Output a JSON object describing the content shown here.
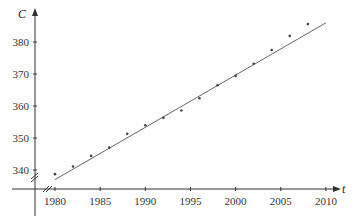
{
  "chart_data": {
    "type": "scatter",
    "title": "",
    "xlabel": "t",
    "ylabel": "C",
    "x_ticks": [
      1980,
      1985,
      1990,
      1995,
      2000,
      2005,
      2010
    ],
    "y_ticks": [
      340,
      350,
      360,
      370,
      380
    ],
    "xlim": [
      1977,
      2012
    ],
    "ylim": [
      334,
      389
    ],
    "grid": false,
    "axis_breaks": true,
    "series": [
      {
        "name": "data",
        "kind": "points",
        "x": [
          1980,
          1982,
          1984,
          1986,
          1988,
          1990,
          1992,
          1994,
          1996,
          1998,
          2000,
          2002,
          2004,
          2006,
          2008
        ],
        "y": [
          338.7,
          341.1,
          344.4,
          347.0,
          351.3,
          354.0,
          356.3,
          358.6,
          362.4,
          366.5,
          369.4,
          373.2,
          377.5,
          381.9,
          385.6
        ]
      },
      {
        "name": "fit line",
        "kind": "line",
        "x": [
          1980,
          2010
        ],
        "y": [
          337.0,
          386.0
        ]
      }
    ],
    "colors": {
      "axis": "#333333",
      "line": "#555555",
      "points": "#444444"
    }
  }
}
